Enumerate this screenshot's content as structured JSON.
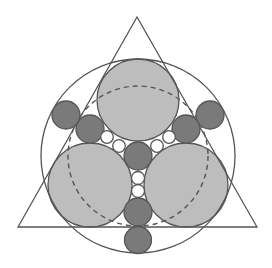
{
  "diagram": {
    "colors": {
      "stroke": "#555555",
      "large_fill": "#bdbdbd",
      "dark_fill": "#7a7a7a",
      "small_fill": "#ffffff",
      "background": "#ffffff"
    },
    "triangle": {
      "points": "137,17 18,227 257,227"
    },
    "outer_circle": {
      "cx": 138,
      "cy": 156,
      "r": 97
    },
    "dashed_circle": {
      "cx": 138,
      "cy": 156,
      "r": 70
    },
    "large_circles": [
      {
        "cx": 138,
        "cy": 100,
        "r": 41
      },
      {
        "cx": 90,
        "cy": 185,
        "r": 42
      },
      {
        "cx": 186,
        "cy": 185,
        "r": 42
      }
    ],
    "dark_circles": [
      {
        "cx": 138,
        "cy": 156,
        "r": 14
      },
      {
        "cx": 138,
        "cy": 212,
        "r": 14
      },
      {
        "cx": 138,
        "cy": 240,
        "r": 13.5
      },
      {
        "cx": 90,
        "cy": 129,
        "r": 14
      },
      {
        "cx": 66,
        "cy": 115,
        "r": 14
      },
      {
        "cx": 186,
        "cy": 129,
        "r": 14
      },
      {
        "cx": 210,
        "cy": 115,
        "r": 14
      }
    ],
    "small_circles": [
      {
        "cx": 107,
        "cy": 137,
        "r": 6.3
      },
      {
        "cx": 119,
        "cy": 146,
        "r": 6.3
      },
      {
        "cx": 157,
        "cy": 146,
        "r": 6.3
      },
      {
        "cx": 169,
        "cy": 137,
        "r": 6.3
      },
      {
        "cx": 138,
        "cy": 178,
        "r": 6.5
      },
      {
        "cx": 138,
        "cy": 191,
        "r": 6.5
      }
    ]
  }
}
